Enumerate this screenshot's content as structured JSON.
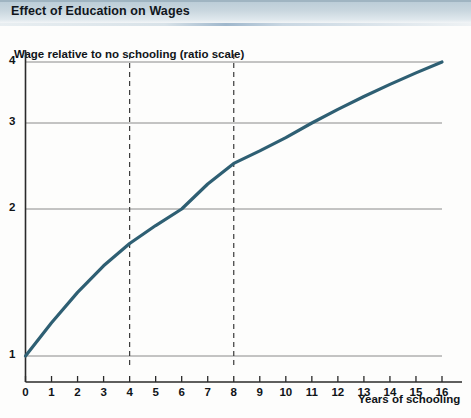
{
  "header": {
    "title": "Effect of Education on Wages"
  },
  "figure": {
    "y_axis_title": "Wage relative to no schooling (ratio scale)",
    "x_axis_title": "Years of schooling"
  },
  "colors": {
    "title_bar": "#c8d6de",
    "curve": "#2e5f73",
    "gridline": "#8a8a8a",
    "axis": "#2a2a2a",
    "dashed_guide": "#3a3a3a",
    "page_background": "#fdfdfc"
  },
  "chart_data": {
    "type": "line",
    "title": "Effect of Education on Wages",
    "xlabel": "Years of schooling",
    "ylabel": "Wage relative to no schooling (ratio scale)",
    "yscale": "log",
    "xlim": [
      0,
      16
    ],
    "ylim": [
      1,
      4
    ],
    "grid": true,
    "legend": "none",
    "x_ticks": [
      0,
      1,
      2,
      3,
      4,
      5,
      6,
      7,
      8,
      9,
      10,
      11,
      12,
      13,
      14,
      15,
      16
    ],
    "x_tick_labels": [
      "0",
      "1",
      "2",
      "3",
      "4",
      "5",
      "6",
      "7",
      "8",
      "9",
      "10",
      "11",
      "12",
      "13",
      "14",
      "15",
      "16"
    ],
    "y_ticks": [
      1,
      2,
      3,
      4
    ],
    "y_tick_labels": [
      "1",
      "2",
      "3",
      "4"
    ],
    "series": [
      {
        "name": "Wage relative to no schooling",
        "x": [
          0,
          1,
          2,
          3,
          4,
          5,
          6,
          7,
          8,
          9,
          10,
          11,
          12,
          13,
          14,
          15,
          16
        ],
        "values": [
          1.0,
          1.17,
          1.35,
          1.53,
          1.7,
          1.85,
          2.0,
          2.25,
          2.48,
          2.63,
          2.8,
          3.0,
          3.2,
          3.4,
          3.6,
          3.8,
          4.0
        ]
      }
    ],
    "annotations": [
      {
        "type": "vline",
        "x": 4,
        "style": "dashed",
        "label": ""
      },
      {
        "type": "vline",
        "x": 8,
        "style": "dashed",
        "label": ""
      }
    ]
  }
}
